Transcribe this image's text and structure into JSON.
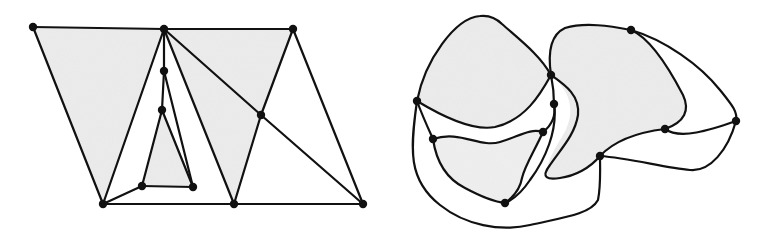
{
  "figure": {
    "colors": {
      "ink": "#111111",
      "shade": "#ececec",
      "background": "#ffffff"
    },
    "left_graph": {
      "description": "Straight-line planar graph (triangulation) with shaded faces",
      "nodes": [
        {
          "id": "A",
          "x": 33,
          "y": 27
        },
        {
          "id": "B",
          "x": 164,
          "y": 29
        },
        {
          "id": "C",
          "x": 293,
          "y": 29
        },
        {
          "id": "D",
          "x": 164,
          "y": 71
        },
        {
          "id": "E",
          "x": 162,
          "y": 110
        },
        {
          "id": "F",
          "x": 261,
          "y": 115
        },
        {
          "id": "G",
          "x": 142,
          "y": 186
        },
        {
          "id": "H",
          "x": 193,
          "y": 187
        },
        {
          "id": "I",
          "x": 103,
          "y": 204
        },
        {
          "id": "J",
          "x": 234,
          "y": 204
        },
        {
          "id": "K",
          "x": 363,
          "y": 204
        }
      ],
      "edges": [
        [
          "A",
          "B"
        ],
        [
          "B",
          "C"
        ],
        [
          "A",
          "I"
        ],
        [
          "I",
          "B"
        ],
        [
          "B",
          "D"
        ],
        [
          "D",
          "E"
        ],
        [
          "E",
          "G"
        ],
        [
          "G",
          "H"
        ],
        [
          "H",
          "D"
        ],
        [
          "E",
          "H"
        ],
        [
          "I",
          "G"
        ],
        [
          "B",
          "J"
        ],
        [
          "B",
          "F"
        ],
        [
          "F",
          "K"
        ],
        [
          "C",
          "F"
        ],
        [
          "F",
          "J"
        ],
        [
          "C",
          "K"
        ],
        [
          "I",
          "J"
        ],
        [
          "J",
          "K"
        ]
      ],
      "shaded_faces": [
        [
          "A",
          "B",
          "I"
        ],
        [
          "E",
          "G",
          "H"
        ],
        [
          "B",
          "F",
          "J"
        ],
        [
          "B",
          "C",
          "F"
        ]
      ]
    },
    "right_graph": {
      "description": "Curved-edge planar drawing of the same structure with shaded regions",
      "nodes": [
        {
          "id": "P1",
          "x": 417,
          "y": 101
        },
        {
          "id": "P2",
          "x": 551,
          "y": 75
        },
        {
          "id": "P3",
          "x": 554,
          "y": 104
        },
        {
          "id": "P4",
          "x": 543,
          "y": 132
        },
        {
          "id": "P5",
          "x": 433,
          "y": 139
        },
        {
          "id": "P6",
          "x": 505,
          "y": 203
        },
        {
          "id": "P7",
          "x": 631,
          "y": 30
        },
        {
          "id": "P8",
          "x": 665,
          "y": 129
        },
        {
          "id": "P9",
          "x": 736,
          "y": 121
        },
        {
          "id": "P10",
          "x": 600,
          "y": 156
        }
      ]
    }
  }
}
